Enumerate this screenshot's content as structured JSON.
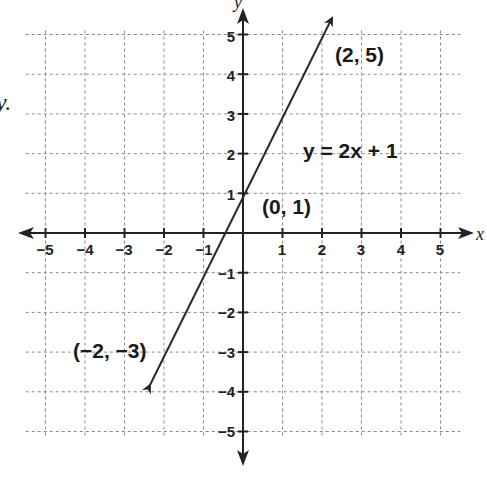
{
  "chart_data": {
    "type": "line",
    "title": "",
    "xlabel": "x",
    "ylabel": "y",
    "xlim": [
      -5,
      5
    ],
    "ylim": [
      -5,
      5
    ],
    "grid": true,
    "grid_style": "dotted",
    "x_ticks": [
      -5,
      -4,
      -3,
      -2,
      -1,
      1,
      2,
      3,
      4,
      5
    ],
    "y_ticks": [
      5,
      4,
      3,
      2,
      1,
      -1,
      -2,
      -3,
      -4,
      -5
    ],
    "series": [
      {
        "name": "y = 2x + 1",
        "equation": "y = 2x + 1",
        "slope": 2,
        "intercept": 1,
        "x": [
          -2.5,
          2.35
        ],
        "y": [
          -4,
          5.7
        ],
        "arrows": "both"
      }
    ],
    "annotations": [
      {
        "text": "(2, 5)",
        "x": 2,
        "y": 5
      },
      {
        "text": "(0, 1)",
        "x": 0,
        "y": 1
      },
      {
        "text": "(−2, −3)",
        "x": -2,
        "y": -3
      },
      {
        "text": "y = 2x + 1",
        "position": "right of line near y=2"
      }
    ]
  },
  "labels": {
    "x_axis": "x",
    "y_axis": "y",
    "stray_text": "y.",
    "equation": "y = 2x + 1",
    "point_top": "(2, 5)",
    "point_mid": "(0, 1)",
    "point_bottom": "(−2, −3)",
    "x_ticks": [
      "−5",
      "−4",
      "−3",
      "−2",
      "−1",
      "1",
      "2",
      "3",
      "4",
      "5"
    ],
    "y_ticks": [
      "5",
      "4",
      "3",
      "2",
      "1",
      "−1",
      "−2",
      "−3",
      "−4",
      "−5"
    ]
  },
  "colors": {
    "line": "#2a2a2a",
    "grid": "#777777",
    "axis": "#222222",
    "background": "#ffffff"
  }
}
